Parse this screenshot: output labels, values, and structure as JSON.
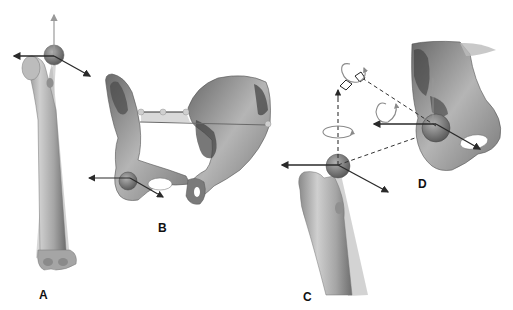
{
  "figure": {
    "panels": [
      {
        "id": "A",
        "label": "A",
        "subject": "femur with hip joint center axes",
        "label_pos": [
          39,
          289
        ]
      },
      {
        "id": "B",
        "label": "B",
        "subject": "pelvis with acetabulum axes and ASIS line",
        "label_pos": [
          158,
          222
        ]
      },
      {
        "id": "C",
        "label": "C",
        "subject": "proximal femur with head axes",
        "label_pos": [
          303,
          291
        ]
      },
      {
        "id": "D",
        "label": "D",
        "subject": "hemipelvis with acetabulum axes and rotation symbols",
        "label_pos": [
          418,
          178
        ]
      }
    ],
    "colors": {
      "bone_light": "#d4d4d4",
      "bone_mid": "#a8a8a8",
      "bone_dark": "#5a5a5a",
      "arrow": "#2a2a2a",
      "axis_vertical": "#9a9a9a",
      "rotation": "#8a8a8a",
      "background": "#ffffff"
    }
  }
}
